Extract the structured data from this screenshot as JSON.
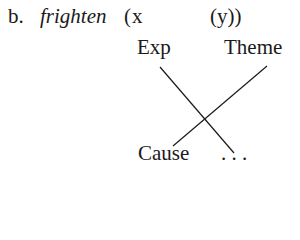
{
  "example": {
    "label": "b.",
    "predicate": "frighten",
    "open_paren": "(",
    "arg1": "x",
    "arg2": "(y))"
  },
  "roles": {
    "top_left": "Exp",
    "top_right": "Theme"
  },
  "bottom": {
    "left": "Cause",
    "right": ". . ."
  },
  "lines": [
    {
      "from": "Exp",
      "to": ". . .",
      "x1": 160,
      "y1": 67,
      "x2": 234,
      "y2": 153
    },
    {
      "from": "Theme",
      "to": "Cause",
      "x1": 267,
      "y1": 66,
      "x2": 173,
      "y2": 146
    }
  ]
}
